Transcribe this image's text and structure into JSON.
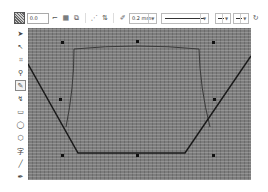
{
  "toolbar": {
    "pattern_icon": "pattern-fill-icon",
    "position_value": "0.0",
    "buttons": [
      {
        "name": "close-curve-icon",
        "glyph": "⌐"
      },
      {
        "name": "wrap-icon",
        "glyph": "▦"
      },
      {
        "name": "mirror-icon",
        "glyph": "⧉"
      },
      {
        "name": "node-connect-icon",
        "glyph": "⋰"
      },
      {
        "name": "align-icon",
        "glyph": "⇅"
      }
    ],
    "outline_icon": "pen-outline-icon",
    "outline_width": "0.2 mm",
    "line_style": "———————",
    "start_arrow": "—",
    "end_arrow": "—",
    "last_icon": "rotate-icon"
  },
  "toolbox": {
    "tools": [
      {
        "name": "pick-tool",
        "glyph": "➤",
        "active": false
      },
      {
        "name": "shape-tool",
        "glyph": "↖",
        "active": false
      },
      {
        "name": "crop-tool",
        "glyph": "⌗",
        "active": false
      },
      {
        "name": "zoom-tool",
        "glyph": "🔍",
        "active": false
      },
      {
        "name": "freehand-tool",
        "glyph": "✎",
        "active": true
      },
      {
        "name": "smart-fill-tool",
        "glyph": "↯",
        "active": false
      },
      {
        "name": "rectangle-tool",
        "glyph": "▭",
        "active": false
      },
      {
        "name": "ellipse-tool",
        "glyph": "◯",
        "active": false
      },
      {
        "name": "polygon-tool",
        "glyph": "⬡",
        "active": false
      },
      {
        "name": "text-tool",
        "glyph": "字",
        "active": false
      },
      {
        "name": "line-tool",
        "glyph": "╱",
        "active": false
      },
      {
        "name": "eyedropper-tool",
        "glyph": "✒",
        "active": false
      }
    ]
  },
  "canvas": {
    "fill": "#7d7d7d",
    "line_color": "#1a1a1a",
    "inner_line_color": "#3a3a3a",
    "node_color": "#111111"
  }
}
